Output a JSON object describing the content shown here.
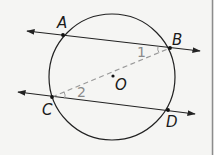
{
  "diagram": {
    "type": "circle-with-parallel-secants",
    "colors": {
      "line": "#222222",
      "dashed": "#9a9a9a",
      "angle_label": "#8a8a8a",
      "background": "#f5f5f3",
      "border": "#8c8c8c"
    },
    "circle": {
      "center_label": "O",
      "cx": 112,
      "cy": 77,
      "r": 63
    },
    "points": {
      "A": {
        "label": "A",
        "x": 63,
        "y": 35
      },
      "B": {
        "label": "B",
        "x": 170,
        "y": 48
      },
      "C": {
        "label": "C",
        "x": 52,
        "y": 97
      },
      "D": {
        "label": "D",
        "x": 168,
        "y": 110
      },
      "O": {
        "label": "O",
        "x": 113,
        "y": 76
      }
    },
    "lines": [
      {
        "name": "line-AB",
        "through": [
          "A",
          "B"
        ],
        "style": "solid",
        "arrows": "both"
      },
      {
        "name": "line-CD",
        "through": [
          "C",
          "D"
        ],
        "style": "solid",
        "arrows": "both"
      },
      {
        "name": "segment-CB",
        "through": [
          "C",
          "B"
        ],
        "style": "dashed",
        "arrows": "none"
      }
    ],
    "angles": [
      {
        "label": "1",
        "vertex": "B",
        "between": [
          "A",
          "C"
        ]
      },
      {
        "label": "2",
        "vertex": "C",
        "between": [
          "B",
          "D"
        ]
      }
    ]
  }
}
